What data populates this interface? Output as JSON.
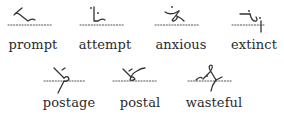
{
  "rows": [
    {
      "words": [
        {
          "word": "prompt",
          "outline_icon": "shorthand-outline-prompt"
        },
        {
          "word": "attempt",
          "outline_icon": "shorthand-outline-attempt"
        },
        {
          "word": "anxious",
          "outline_icon": "shorthand-outline-anxious"
        },
        {
          "word": "extinct",
          "outline_icon": "shorthand-outline-extinct"
        }
      ]
    },
    {
      "words": [
        {
          "word": "postage",
          "outline_icon": "shorthand-outline-postage"
        },
        {
          "word": "postal",
          "outline_icon": "shorthand-outline-postal"
        },
        {
          "word": "wasteful",
          "outline_icon": "shorthand-outline-wasteful"
        }
      ]
    }
  ]
}
